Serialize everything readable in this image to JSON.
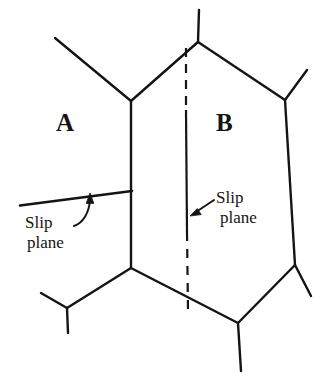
{
  "figure": {
    "name": "grain-boundary-slip-plane-diagram",
    "background_color": "#ffffff",
    "ink_color": "#141414",
    "width": 330,
    "height": 380
  },
  "grains": [
    {
      "id": "A",
      "label": "A",
      "label_x": 56,
      "label_y": 110
    },
    {
      "id": "B",
      "label": "B",
      "label_x": 216,
      "label_y": 110
    }
  ],
  "annotations": [
    {
      "id": "slip-plane-left",
      "line1": "Slip",
      "line2": "plane",
      "label_x": 25,
      "label_y": 213,
      "arrow_style": "curved",
      "arrow_tip_x": 90,
      "arrow_tip_y": 194
    },
    {
      "id": "slip-plane-right",
      "line1": "Slip",
      "line2": "plane",
      "label_x": 216,
      "label_y": 188,
      "arrow_style": "straight",
      "arrow_tip_x": 191,
      "arrow_tip_y": 215
    }
  ],
  "geometry": {
    "hexagon_vertices": [
      {
        "x": 198,
        "y": 42
      },
      {
        "x": 285,
        "y": 100
      },
      {
        "x": 295,
        "y": 265
      },
      {
        "x": 238,
        "y": 323
      },
      {
        "x": 131,
        "y": 268
      },
      {
        "x": 131,
        "y": 101
      }
    ],
    "boundary_stubs": [
      {
        "x1": 198,
        "y1": 42,
        "x2": 199,
        "y2": 10
      },
      {
        "x1": 285,
        "y1": 100,
        "x2": 307,
        "y2": 70
      },
      {
        "x1": 295,
        "y1": 265,
        "x2": 311,
        "y2": 296
      },
      {
        "x1": 238,
        "y1": 323,
        "x2": 241,
        "y2": 371
      },
      {
        "x1": 131,
        "y1": 101,
        "x2": 55,
        "y2": 38
      },
      {
        "x1": 131,
        "y1": 268,
        "x2": 67,
        "y2": 308
      },
      {
        "x1": 67,
        "y1": 308,
        "x2": 41,
        "y2": 293
      },
      {
        "x1": 67,
        "y1": 308,
        "x2": 68,
        "y2": 333
      }
    ],
    "slip_plane_left": {
      "x1": 20,
      "y1": 205,
      "x2": 132,
      "y2": 191
    },
    "slip_plane_right_segments": [
      {
        "x1": 186,
        "y1": 48,
        "x2": 186,
        "y2": 110,
        "style": "dashed"
      },
      {
        "x1": 186,
        "y1": 110,
        "x2": 187,
        "y2": 232,
        "style": "solid"
      },
      {
        "x1": 187,
        "y1": 232,
        "x2": 188,
        "y2": 311,
        "style": "dashed"
      }
    ]
  }
}
